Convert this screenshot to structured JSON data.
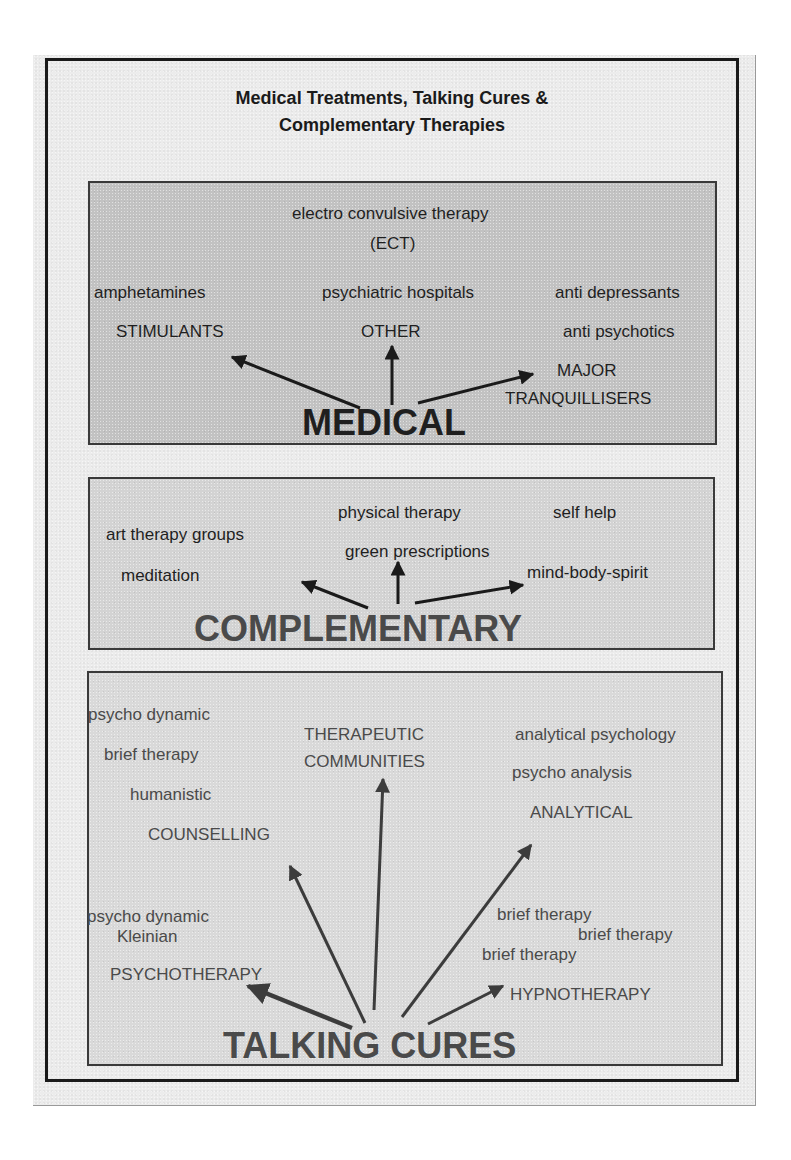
{
  "title": {
    "line1": "Medical Treatments, Talking Cures &",
    "line2": "Complementary Therapies"
  },
  "medical": {
    "heading": "MEDICAL",
    "other_examples": [
      "electro convulsive therapy",
      "(ECT)",
      "psychiatric hospitals"
    ],
    "branches": {
      "stimulants": {
        "label": "STIMULANTS",
        "examples": [
          "amphetamines"
        ]
      },
      "other": {
        "label": "OTHER",
        "examples": [
          "psychiatric hospitals",
          "electro convulsive therapy (ECT)"
        ]
      },
      "major_tranquillisers": {
        "label_line1": "MAJOR",
        "label_line2": "TRANQUILLISERS",
        "examples": [
          "anti depressants",
          "anti psychotics"
        ]
      }
    },
    "texts": {
      "ect_line1": "electro convulsive therapy",
      "ect_line2": "(ECT)",
      "amphetamines": "amphetamines",
      "psychiatric_hospitals": "psychiatric hospitals",
      "anti_depressants": "anti depressants",
      "stimulants": "STIMULANTS",
      "other": "OTHER",
      "anti_psychotics": "anti psychotics",
      "major": "MAJOR",
      "tranquillisers": "TRANQUILLISERS"
    }
  },
  "complementary": {
    "heading": "COMPLEMENTARY",
    "texts": {
      "physical_therapy": "physical therapy",
      "self_help": "self help",
      "art_therapy_groups": "art therapy groups",
      "green_prescriptions": "green prescriptions",
      "meditation": "meditation",
      "mind_body_spirit": "mind-body-spirit"
    }
  },
  "talking_cures": {
    "heading": "TALKING CURES",
    "texts": {
      "psycho_dynamic_1": "psycho dynamic",
      "brief_therapy_1": "brief therapy",
      "humanistic": "humanistic",
      "counselling": "COUNSELLING",
      "therapeutic": "THERAPEUTIC",
      "communities": "COMMUNITIES",
      "analytical_psychology": "analytical psychology",
      "psycho_analysis": "psycho analysis",
      "analytical": "ANALYTICAL",
      "psycho_dynamic_2": "psycho dynamic",
      "kleinian": "Kleinian",
      "psychotherapy": "PSYCHOTHERAPY",
      "brief_therapy_2": "brief therapy",
      "brief_therapy_3": "brief therapy",
      "brief_therapy_4": "brief therapy",
      "hypnotherapy": "HYPNOTHERAPY"
    }
  },
  "colors": {
    "medical_bg": "#c2c2c2",
    "complementary_bg": "#d3d3d3",
    "talking_bg": "#d9d9d9",
    "dark_text": "#1f1f1f",
    "grey_text": "#4a4a4a"
  }
}
